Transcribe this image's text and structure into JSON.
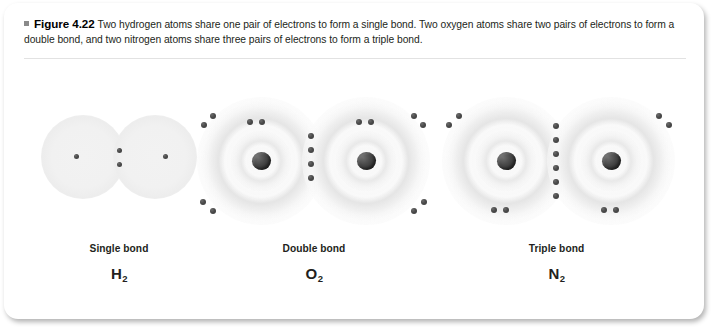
{
  "figure": {
    "bullet_icon": "square-bullet-icon",
    "number_label": "Figure 4.22",
    "caption": "Two hydrogen atoms share one pair of electrons to form a single bond. Two oxygen atoms share two pairs of electrons to form a double bond, and two nitrogen atoms share three pairs of electrons to form a triple bond."
  },
  "colors": {
    "text": "#231f20",
    "bullet": "#8a8a8a",
    "nucleus": "#3a3a3a",
    "electron": "#4a4a4a",
    "shell": "#e8e8e8",
    "card_background": "#ffffff",
    "rule": "#e2e2e2"
  },
  "molecules": [
    {
      "id": "hydrogen",
      "bond_label": "Single bond",
      "formula_symbol": "H",
      "formula_subscript": "2",
      "shared_electron_count": 2,
      "shared_pairs": 1,
      "shell_count": 1,
      "atom_count": 2,
      "has_visible_nucleus": false,
      "unshared_electrons_per_atom": 1
    },
    {
      "id": "oxygen",
      "bond_label": "Double bond",
      "formula_symbol": "O",
      "formula_subscript": "2",
      "shared_electron_count": 4,
      "shared_pairs": 2,
      "shell_count": 2,
      "atom_count": 2,
      "has_visible_nucleus": true,
      "unshared_electrons_per_atom": 4
    },
    {
      "id": "nitrogen",
      "bond_label": "Triple bond",
      "formula_symbol": "N",
      "formula_subscript": "2",
      "shared_electron_count": 6,
      "shared_pairs": 3,
      "shell_count": 2,
      "atom_count": 2,
      "has_visible_nucleus": true,
      "unshared_electrons_per_atom": 2
    }
  ]
}
